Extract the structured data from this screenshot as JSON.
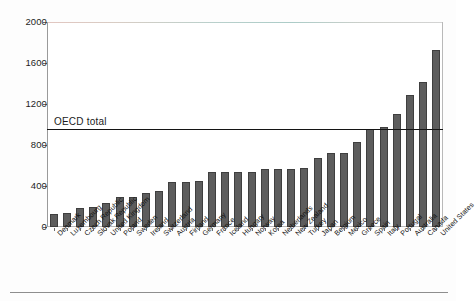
{
  "chart_data": {
    "type": "bar",
    "title": "",
    "subtitle": "",
    "xlabel": "",
    "ylabel": "",
    "ylim": [
      0,
      2000
    ],
    "yticks": [
      0,
      400,
      800,
      1200,
      1600,
      2000
    ],
    "grid": false,
    "legend": null,
    "orientation": "vertical",
    "bar_color": "#5d5d5d",
    "categories": [
      "Denmark",
      "Luxembourg",
      "Czech Republic",
      "Slovak Republic",
      "United Kingdom",
      "Poland",
      "Sweden",
      "Ireland",
      "Switzerland",
      "Austria",
      "Finland",
      "Germany",
      "France",
      "Iceland",
      "Hungary",
      "Norway",
      "Korea",
      "Netherlands",
      "New Zealand",
      "Turkey",
      "Japan",
      "Belgium",
      "Mexico",
      "Greece",
      "Spain",
      "Italy",
      "Portugal",
      "Australia",
      "Canada",
      "United States"
    ],
    "values": [
      125,
      138,
      185,
      198,
      230,
      295,
      292,
      332,
      352,
      440,
      438,
      450,
      540,
      538,
      538,
      535,
      562,
      562,
      562,
      575,
      672,
      722,
      722,
      830,
      958,
      975,
      1100,
      1290,
      1418,
      1730
    ],
    "annotations": [
      {
        "name": "oecd-total-line",
        "label": "OECD total",
        "type": "hline",
        "value": 958
      }
    ]
  },
  "axis": {
    "y_tick_labels": [
      "2000",
      "1600",
      "1200",
      "800",
      "400",
      "0"
    ]
  }
}
